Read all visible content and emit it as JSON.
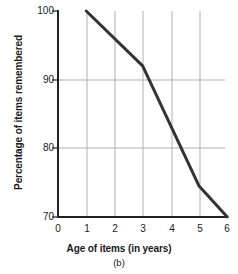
{
  "chart_data": {
    "type": "line",
    "title": "",
    "subtitle": "",
    "xlabel": "Age of items (in years)",
    "ylabel": "Percentage of items remembered",
    "caption": "(b)",
    "xlim": [
      0,
      6
    ],
    "ylim": [
      70,
      100
    ],
    "xticks": [
      0,
      1,
      2,
      3,
      4,
      5,
      6
    ],
    "xtick_labels": [
      "0",
      "1",
      "2",
      "3",
      "4",
      "5",
      "6"
    ],
    "yticks": [
      70,
      80,
      90,
      100
    ],
    "ytick_labels": [
      "70",
      "80",
      "90",
      "100"
    ],
    "grid": {
      "horizontal_at": [
        80,
        90
      ],
      "vertical_at": [
        1,
        2,
        3,
        4,
        5
      ],
      "color": "#b0b0b0"
    },
    "legend": null,
    "series": [
      {
        "name": "Percentage of items remembered",
        "color": "#333333",
        "x": [
          1,
          3,
          5,
          6
        ],
        "values": [
          100,
          92,
          74.5,
          70
        ]
      }
    ]
  },
  "axis": {
    "line_color": "#222222",
    "y_label_text": "Percentage of items remembered",
    "x_label_text": "Age of items (in years)",
    "caption_text": "(b)"
  }
}
